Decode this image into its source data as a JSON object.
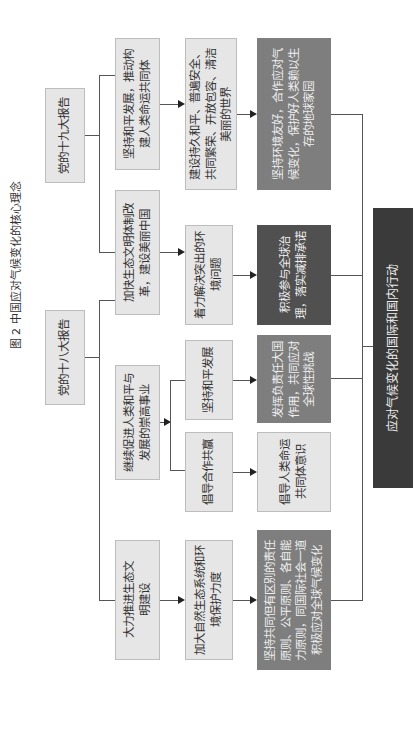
{
  "title": "图 2 中国应对气候变化的核心理念",
  "reports": {
    "r19": "党的十九大报告",
    "r18": "党的十八大报告"
  },
  "level2": {
    "a": "坚持和平发展，推动构建人类命运共同体",
    "b": "加快生态文明体制改革，建设美丽中国",
    "c": "继续促进人类和平与发展的崇高事业",
    "d": "大力推进生态文明建设"
  },
  "level3": {
    "a": "建设持久和平、普遍安全、共同繁荣、开放包容、清洁美丽的世界",
    "b": "着力解决突出的环境问题",
    "c1": "坚持和平发展",
    "c2": "倡导合作共赢",
    "d": "加大自然生态系统和环境保护力度"
  },
  "level4": {
    "a": "坚持环境友好，合作应对气候变化，保护好人类赖以生存的地球家园",
    "b": "积极参与全球治理，落实减排承诺",
    "c1": "发挥负责任大国作用，共同应对全球性挑战",
    "c2": "倡导人类命运共同体意识",
    "d": "坚持共同但有区别的责任原则、公平原则、各自能力原则，同国际社会一道积极应对全球气候变化"
  },
  "final": "应对气候变化的国际和国内行动",
  "colors": {
    "light_box": "#e6e6e6",
    "mid_box": "#7e7e7e",
    "dark_box": "#505050",
    "darkest_box": "#3a3a3a",
    "line": "#555555"
  }
}
